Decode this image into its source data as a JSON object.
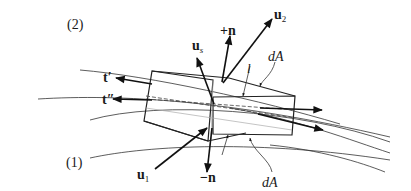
{
  "figure": {
    "regions": {
      "upper": "(2)",
      "lower": "(1)"
    },
    "vectors": {
      "u_s": {
        "base": "u",
        "sub": "s"
      },
      "plus_n": "+n",
      "u_2": {
        "base": "u",
        "sub": "2"
      },
      "t_prime": "t′",
      "t_double_prime": "t″",
      "u_1": {
        "base": "u",
        "sub": "1"
      },
      "minus_n": "−n"
    },
    "labels": {
      "dA_top": "dA",
      "dA_bottom": "dA",
      "thickness": "l"
    }
  }
}
